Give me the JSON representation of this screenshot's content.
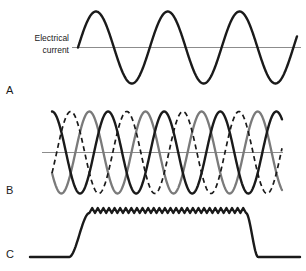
{
  "figure": {
    "title": "",
    "background_color": "#ffffff",
    "width": 306,
    "height": 271
  },
  "labels": {
    "axis_label_line1": "Electrical",
    "axis_label_line2": "current",
    "panel_a": "A",
    "panel_b": "B",
    "panel_c": "C"
  },
  "colors": {
    "wave_black": "#1a1a1a",
    "wave_gray": "#7a7a7a",
    "baseline_gray": "#8c8c8c",
    "text": "#1a1a1a",
    "background": "#ffffff"
  },
  "chart_data": [
    {
      "type": "line",
      "panel": "A",
      "title": "Single-phase alternating current",
      "xlabel": "",
      "ylabel": "Electrical current",
      "grid": false,
      "legend": "none",
      "xlim": [
        0,
        3.05
      ],
      "ylim": [
        -1.15,
        1.15
      ],
      "series": [
        {
          "name": "single-phase sine",
          "style": "solid",
          "color": "#1a1a1a",
          "phase_deg": 0,
          "cycles": 3.05,
          "amplitude": 1.0,
          "x": [
            0,
            0.25,
            0.5,
            0.75,
            1.0,
            1.25,
            1.5,
            1.75,
            2.0,
            2.25,
            2.5,
            2.75,
            3.0,
            3.05
          ],
          "values": [
            0,
            1.0,
            0,
            -1.0,
            0,
            1.0,
            0,
            -1.0,
            0,
            1.0,
            0,
            -1.0,
            0,
            0.35
          ]
        }
      ],
      "baseline_value": 0
    },
    {
      "type": "line",
      "panel": "B",
      "title": "Three-phase alternating current",
      "xlabel": "",
      "ylabel": "",
      "grid": false,
      "legend": "none",
      "xlim": [
        0,
        4.1
      ],
      "ylim": [
        -1.15,
        1.15
      ],
      "series": [
        {
          "name": "phase-1",
          "style": "solid",
          "color": "#1a1a1a",
          "phase_deg": 90,
          "cycles": 4.1,
          "amplitude": 1.0
        },
        {
          "name": "phase-2",
          "style": "dashed",
          "color": "#1a1a1a",
          "phase_deg": -30,
          "cycles": 4.1,
          "amplitude": 1.0
        },
        {
          "name": "phase-3",
          "style": "solid",
          "color": "#7a7a7a",
          "phase_deg": 210,
          "cycles": 4.1,
          "amplitude": 1.0
        }
      ],
      "baseline_value": 0
    },
    {
      "type": "line",
      "panel": "C",
      "title": "Rectified direct current with ripple",
      "xlabel": "",
      "ylabel": "",
      "grid": false,
      "legend": "none",
      "xlim": [
        0,
        1
      ],
      "ylim": [
        0,
        1.1
      ],
      "series": [
        {
          "name": "rectified dc pulse",
          "style": "solid",
          "color": "#1a1a1a",
          "baseline_level": 0,
          "plateau_level": 1.0,
          "ripple_amplitude": 0.06,
          "ripple_teeth": 28,
          "rise_start": 0.145,
          "rise_end": 0.22,
          "fall_start": 0.8,
          "fall_end": 0.845
        }
      ]
    }
  ]
}
